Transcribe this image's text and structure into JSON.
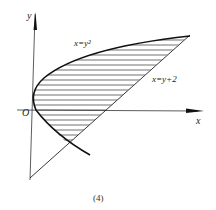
{
  "figure": {
    "caption": "(4)",
    "axes": {
      "x_label": "x",
      "y_label": "y",
      "origin_label": "O"
    },
    "curves": [
      {
        "id": "parabola",
        "label": "x=y²",
        "equation": "x = y^2"
      },
      {
        "id": "line",
        "label": "x=y+2",
        "equation": "x = y + 2"
      }
    ],
    "region": {
      "description": "hatched region bounded by x=y² and x=y+2",
      "fill": "horizontal hatching"
    },
    "colors": {
      "stroke": "#222222",
      "background": "#ffffff"
    }
  }
}
